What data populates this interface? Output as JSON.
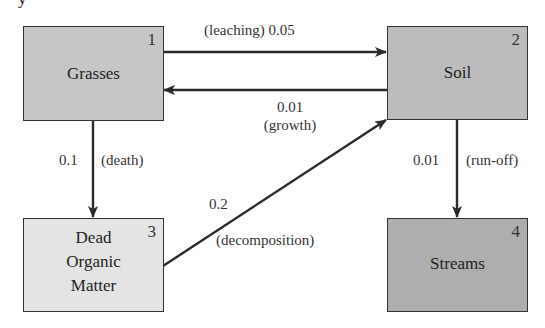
{
  "header": {
    "partial_text": "y"
  },
  "colors": {
    "grasses_fill": "#c6c6c6",
    "soil_fill": "#bcbcbc",
    "dead_organic_matter_fill": "#e4e4e4",
    "streams_fill": "#aeaeae",
    "arrow": "#2a2a2a",
    "border": "#333333"
  },
  "compartments": [
    {
      "id": 1,
      "number": "1",
      "name": "Grasses"
    },
    {
      "id": 2,
      "number": "2",
      "name": "Soil"
    },
    {
      "id": 3,
      "number": "3",
      "name_lines": [
        "Dead",
        "Organic",
        "Matter"
      ]
    },
    {
      "id": 4,
      "number": "4",
      "name": "Streams"
    }
  ],
  "flows": [
    {
      "from": 1,
      "to": 2,
      "rate": "0.05",
      "process": "(leaching)",
      "label": "(leaching) 0.05"
    },
    {
      "from": 2,
      "to": 1,
      "rate": "0.01",
      "process": "(growth)"
    },
    {
      "from": 1,
      "to": 3,
      "rate": "0.1",
      "process": "(death)"
    },
    {
      "from": 3,
      "to": 2,
      "rate": "0.2",
      "process": "(decomposition)"
    },
    {
      "from": 2,
      "to": 4,
      "rate": "0.01",
      "process": "(run-off)"
    }
  ]
}
